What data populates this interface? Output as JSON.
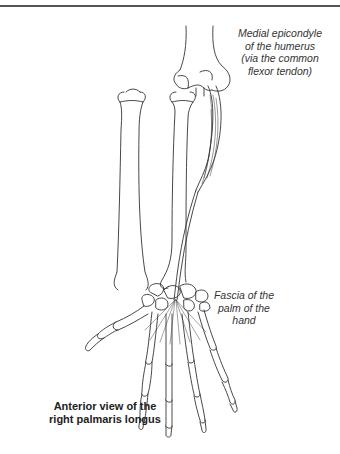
{
  "figure": {
    "subject": "palmaris longus",
    "labels": {
      "origin": {
        "lines": [
          "Medial epicondyle",
          "of the humerus",
          "(via the common",
          "flexor tendon)"
        ]
      },
      "insertion": {
        "lines": [
          "Fascia of the",
          "palm of the",
          "hand"
        ]
      }
    },
    "caption": {
      "lines": [
        "Anterior view of the",
        "right palmaris longus"
      ]
    },
    "colors": {
      "line": "#333333",
      "rule": "#555555",
      "background": "#ffffff"
    }
  }
}
